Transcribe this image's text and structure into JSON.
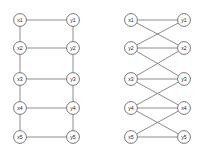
{
  "figure": {
    "title": "",
    "width": 213,
    "height": 153,
    "background_color": "#ffffff",
    "node_fill_color": "#ffffff",
    "node_stroke_color": "#555555",
    "edge_color": "#6e6e6e",
    "label_color": "#222222",
    "node_radius": 6.4
  },
  "graphs": [
    {
      "id": "left-graph",
      "name": "ladder-graph-straight",
      "caption": "",
      "nodes": [
        {
          "id": "L-x1",
          "label": "x1",
          "cx": 20,
          "cy": 20
        },
        {
          "id": "L-y1",
          "label": "y1",
          "cx": 73,
          "cy": 20
        },
        {
          "id": "L-x2",
          "label": "x2",
          "cx": 20,
          "cy": 48
        },
        {
          "id": "L-y2",
          "label": "y2",
          "cx": 73,
          "cy": 48
        },
        {
          "id": "L-x3",
          "label": "x3",
          "cx": 20,
          "cy": 79
        },
        {
          "id": "L-y3",
          "label": "y3",
          "cx": 73,
          "cy": 79
        },
        {
          "id": "L-x4",
          "label": "x4",
          "cx": 20,
          "cy": 108
        },
        {
          "id": "L-y4",
          "label": "y4",
          "cx": 73,
          "cy": 108
        },
        {
          "id": "L-x5",
          "label": "x5",
          "cx": 20,
          "cy": 137
        },
        {
          "id": "L-y5",
          "label": "y5",
          "cx": 73,
          "cy": 137
        }
      ],
      "edges": [
        {
          "source": "L-x1",
          "target": "L-y1"
        },
        {
          "source": "L-x2",
          "target": "L-y2"
        },
        {
          "source": "L-x3",
          "target": "L-y3"
        },
        {
          "source": "L-x4",
          "target": "L-y4"
        },
        {
          "source": "L-x5",
          "target": "L-y5"
        },
        {
          "source": "L-x1",
          "target": "L-x2"
        },
        {
          "source": "L-x2",
          "target": "L-x3"
        },
        {
          "source": "L-x3",
          "target": "L-x4"
        },
        {
          "source": "L-x4",
          "target": "L-x5"
        },
        {
          "source": "L-y1",
          "target": "L-y2"
        },
        {
          "source": "L-y2",
          "target": "L-y3"
        },
        {
          "source": "L-y3",
          "target": "L-y4"
        },
        {
          "source": "L-y4",
          "target": "L-y5"
        }
      ]
    },
    {
      "id": "right-graph",
      "name": "ladder-graph-crossed",
      "caption": "",
      "nodes": [
        {
          "id": "R-x1",
          "label": "x1",
          "cx": 131,
          "cy": 20
        },
        {
          "id": "R-y1",
          "label": "y1",
          "cx": 184,
          "cy": 20
        },
        {
          "id": "R-y2",
          "label": "y2",
          "cx": 131,
          "cy": 48
        },
        {
          "id": "R-x2",
          "label": "x2",
          "cx": 184,
          "cy": 48
        },
        {
          "id": "R-x3",
          "label": "x3",
          "cx": 131,
          "cy": 79
        },
        {
          "id": "R-y3",
          "label": "y3",
          "cx": 184,
          "cy": 79
        },
        {
          "id": "R-y4",
          "label": "y4",
          "cx": 131,
          "cy": 108
        },
        {
          "id": "R-x4",
          "label": "x4",
          "cx": 184,
          "cy": 108
        },
        {
          "id": "R-x5",
          "label": "x5",
          "cx": 131,
          "cy": 137
        },
        {
          "id": "R-y5",
          "label": "y5",
          "cx": 184,
          "cy": 137
        }
      ],
      "edges": [
        {
          "source": "R-x1",
          "target": "R-y1"
        },
        {
          "source": "R-y2",
          "target": "R-x2"
        },
        {
          "source": "R-x3",
          "target": "R-y3"
        },
        {
          "source": "R-y4",
          "target": "R-x4"
        },
        {
          "source": "R-x5",
          "target": "R-y5"
        },
        {
          "source": "R-x1",
          "target": "R-x2"
        },
        {
          "source": "R-x2",
          "target": "R-x3"
        },
        {
          "source": "R-x3",
          "target": "R-x4"
        },
        {
          "source": "R-x4",
          "target": "R-x5"
        },
        {
          "source": "R-y1",
          "target": "R-y2"
        },
        {
          "source": "R-y2",
          "target": "R-y3"
        },
        {
          "source": "R-y3",
          "target": "R-y4"
        },
        {
          "source": "R-y4",
          "target": "R-y5"
        }
      ]
    }
  ]
}
